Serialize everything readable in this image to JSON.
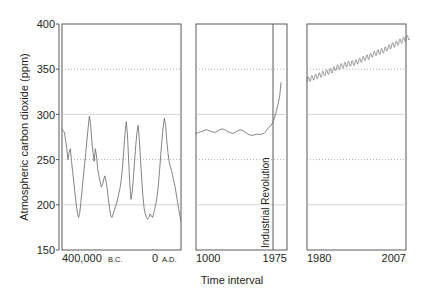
{
  "chart_data": {
    "type": "line",
    "title": "",
    "xlabel": "Time interval",
    "ylabel": "Atmospheric carbon dioxide (ppm)",
    "ylim": [
      150,
      400
    ],
    "yticks": [
      150,
      200,
      250,
      300,
      350,
      400
    ],
    "ytick_labels": [
      "150",
      "200",
      "250",
      "300",
      "350",
      "400"
    ],
    "grid": true,
    "grid_axis": "y",
    "legend": "none",
    "broken_axis": true,
    "panels": [
      {
        "name": "ice-core-record",
        "xlabel_left": "400,000",
        "xlabel_left_era": "B.C.",
        "xlabel_right": "0",
        "xlabel_right_era": "A.D.",
        "xlim": [
          -400000,
          0
        ],
        "xticks": [
          -400000,
          0
        ],
        "series": [
          {
            "name": "CO2 ice core",
            "x": [
              -400000,
              -396000,
              -392000,
              -388000,
              -384000,
              -380000,
              -376000,
              -372000,
              -368000,
              -364000,
              -360000,
              -356000,
              -352000,
              -348000,
              -344000,
              -340000,
              -336000,
              -332000,
              -328000,
              -324000,
              -320000,
              -316000,
              -312000,
              -308000,
              -304000,
              -300000,
              -296000,
              -292000,
              -288000,
              -284000,
              -280000,
              -276000,
              -272000,
              -268000,
              -264000,
              -260000,
              -256000,
              -252000,
              -248000,
              -244000,
              -240000,
              -236000,
              -232000,
              -228000,
              -224000,
              -220000,
              -216000,
              -212000,
              -208000,
              -204000,
              -200000,
              -196000,
              -192000,
              -188000,
              -184000,
              -180000,
              -176000,
              -172000,
              -168000,
              -164000,
              -160000,
              -156000,
              -152000,
              -148000,
              -144000,
              -140000,
              -136000,
              -132000,
              -128000,
              -124000,
              -120000,
              -116000,
              -112000,
              -108000,
              -104000,
              -100000,
              -96000,
              -92000,
              -88000,
              -84000,
              -80000,
              -76000,
              -72000,
              -68000,
              -64000,
              -60000,
              -56000,
              -52000,
              -48000,
              -44000,
              -40000,
              -36000,
              -32000,
              -28000,
              -24000,
              -20000,
              -16000,
              -12000,
              -8000,
              -4000,
              0
            ],
            "values": [
              284,
              282,
              280,
              272,
              262,
              250,
              258,
              262,
              248,
              236,
              224,
              212,
              200,
              190,
              186,
              192,
              205,
              218,
              232,
              245,
              258,
              272,
              286,
              298,
              290,
              272,
              258,
              248,
              262,
              254,
              240,
              232,
              226,
              220,
              222,
              228,
              232,
              226,
              218,
              206,
              196,
              188,
              186,
              190,
              194,
              198,
              202,
              208,
              214,
              220,
              230,
              244,
              262,
              280,
              292,
              278,
              250,
              222,
              206,
              214,
              230,
              248,
              266,
              280,
              288,
              272,
              250,
              228,
              210,
              196,
              190,
              186,
              184,
              186,
              190,
              188,
              186,
              190,
              196,
              202,
              210,
              222,
              238,
              256,
              272,
              286,
              296,
              288,
              272,
              258,
              248,
              242,
              238,
              232,
              226,
              220,
              212,
              204,
              196,
              188,
              182
            ]
          }
        ]
      },
      {
        "name": "last-millennium",
        "xlabel_left": "1000",
        "xlabel_right": "1975",
        "xlim": [
          1000,
          1975
        ],
        "xticks": [
          1000,
          1975
        ],
        "annotation": "Industrial Revolution",
        "annotation_x": 1820,
        "series": [
          {
            "name": "CO2 last millennium",
            "x": [
              1000,
              1030,
              1060,
              1090,
              1120,
              1150,
              1180,
              1210,
              1240,
              1270,
              1300,
              1330,
              1360,
              1390,
              1420,
              1450,
              1480,
              1510,
              1540,
              1570,
              1600,
              1630,
              1660,
              1690,
              1720,
              1750,
              1780,
              1800,
              1820,
              1840,
              1860,
              1880,
              1900,
              1920,
              1940,
              1960,
              1975
            ],
            "values": [
              279,
              280,
              281,
              282,
              283,
              282,
              281,
              280,
              281,
              283,
              284,
              283,
              281,
              280,
              279,
              280,
              282,
              283,
              282,
              280,
              278,
              277,
              277,
              278,
              278,
              278,
              279,
              281,
              284,
              286,
              288,
              291,
              296,
              303,
              311,
              320,
              335
            ]
          }
        ]
      },
      {
        "name": "modern-keeling-curve",
        "xlabel_left": "1980",
        "xlabel_right": "2007",
        "xlim": [
          1980,
          2007
        ],
        "xticks": [
          1980,
          2007
        ],
        "series": [
          {
            "name": "CO2 modern monthly",
            "annual_means": [
              338,
              339.8,
              341,
              342.6,
              344.3,
              345.9,
              347.2,
              348.9,
              351.5,
              352.9,
              354.2,
              355.6,
              356.4,
              357,
              358.8,
              360.8,
              362.6,
              363.8,
              366.6,
              368.3,
              369.5,
              371,
              373.2,
              375.8,
              377.5,
              379.8,
              381.9,
              383.8
            ],
            "seasonal_amplitude": 3.0,
            "years": [
              1980,
              1981,
              1982,
              1983,
              1984,
              1985,
              1986,
              1987,
              1988,
              1989,
              1990,
              1991,
              1992,
              1993,
              1994,
              1995,
              1996,
              1997,
              1998,
              1999,
              2000,
              2001,
              2002,
              2003,
              2004,
              2005,
              2006,
              2007
            ]
          }
        ]
      }
    ],
    "colors": {
      "line": "#6d6e71",
      "axis": "#58595b",
      "grid": "#9a9a9a",
      "text": "#231f20",
      "background": "#ffffff"
    }
  },
  "labels": {
    "ylabel": "Atmospheric carbon dioxide (ppm)",
    "xlabel": "Time interval",
    "y_ticks": [
      "400",
      "350",
      "300",
      "250",
      "200",
      "150"
    ],
    "panel1_left_num": "400,000",
    "panel1_left_era": "B.C.",
    "panel1_right_num": "0",
    "panel1_right_era": "A.D.",
    "panel2_left": "1000",
    "panel2_right": "1975",
    "panel3_left": "1980",
    "panel3_right": "2007",
    "industrial_revolution": "Industrial Revolution"
  }
}
